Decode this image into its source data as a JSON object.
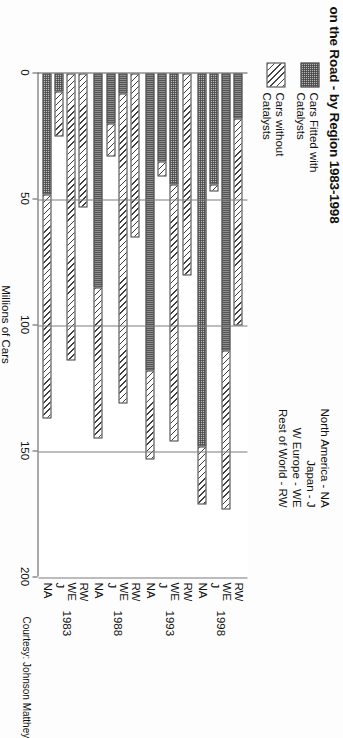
{
  "title": "on the Road - by Region 1983-1998",
  "courtesy": "Courtesy: Johnson Matthey",
  "legend": {
    "items": [
      {
        "label": "Cars Fitted with\nCatalysts",
        "pattern": "dot"
      },
      {
        "label": "Cars without\nCatalysts",
        "pattern": "hatch"
      }
    ]
  },
  "region_key": {
    "lines": [
      "North America - NA",
      "Japan - J",
      "W Europe - WE",
      "Rest of World - RW"
    ]
  },
  "chart_data": {
    "type": "bar",
    "title": "on the Road - by Region 1983-1998",
    "subtype": "stacked-horizontal",
    "xlabel": "",
    "ylabel": "Millions of Cars",
    "axis_title": "Millions of Cars",
    "value_ticks": [
      "0",
      "50",
      "100",
      "150",
      "200"
    ],
    "value_tick_values": [
      0,
      50,
      100,
      150,
      200
    ],
    "ylim": [
      0,
      200
    ],
    "grid": true,
    "legend_position": "top-left",
    "groups": [
      "1983",
      "1988",
      "1993",
      "1998"
    ],
    "regions": [
      "NA",
      "J",
      "WE",
      "RW"
    ],
    "series": [
      {
        "name": "Cars Fitted with Catalysts",
        "pattern": "dot"
      },
      {
        "name": "Cars without Catalysts",
        "pattern": "hatch"
      }
    ],
    "bars": [
      {
        "group": "1983",
        "region": "NA",
        "fitted": 48,
        "without": 89,
        "total": 137
      },
      {
        "group": "1983",
        "region": "J",
        "fitted": 7,
        "without": 18,
        "total": 25
      },
      {
        "group": "1983",
        "region": "WE",
        "fitted": 0,
        "without": 114,
        "total": 114
      },
      {
        "group": "1983",
        "region": "RW",
        "fitted": 0,
        "without": 53,
        "total": 53
      },
      {
        "group": "1988",
        "region": "NA",
        "fitted": 85,
        "without": 60,
        "total": 145
      },
      {
        "group": "1988",
        "region": "J",
        "fitted": 20,
        "without": 13,
        "total": 33
      },
      {
        "group": "1988",
        "region": "WE",
        "fitted": 8,
        "without": 123,
        "total": 131
      },
      {
        "group": "1988",
        "region": "RW",
        "fitted": 0,
        "without": 65,
        "total": 65
      },
      {
        "group": "1993",
        "region": "NA",
        "fitted": 118,
        "without": 35,
        "total": 153
      },
      {
        "group": "1993",
        "region": "J",
        "fitted": 35,
        "without": 6,
        "total": 41
      },
      {
        "group": "1993",
        "region": "WE",
        "fitted": 44,
        "without": 102,
        "total": 146
      },
      {
        "group": "1993",
        "region": "RW",
        "fitted": 0,
        "without": 80,
        "total": 80
      },
      {
        "group": "1998",
        "region": "NA",
        "fitted": 148,
        "without": 23,
        "total": 171
      },
      {
        "group": "1998",
        "region": "J",
        "fitted": 44,
        "without": 3,
        "total": 47
      },
      {
        "group": "1998",
        "region": "WE",
        "fitted": 110,
        "without": 63,
        "total": 173
      },
      {
        "group": "1998",
        "region": "RW",
        "fitted": 18,
        "without": 82,
        "total": 100
      }
    ]
  }
}
